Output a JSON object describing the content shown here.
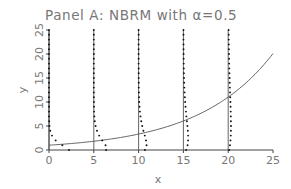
{
  "chart_data": {
    "type": "line",
    "title": "Panel A: NBRM with α=0.5",
    "xlabel": "x",
    "ylabel": "y",
    "xlim": [
      0,
      25
    ],
    "ylim": [
      0,
      25
    ],
    "xticks": [
      0,
      5,
      10,
      15,
      20,
      25
    ],
    "yticks": [
      0,
      5,
      10,
      15,
      20,
      25
    ],
    "grid": false,
    "legend": null,
    "series": [
      {
        "name": "mean curve",
        "kind": "line",
        "description": "exponential mean function, approx y = exp(0.12 x)",
        "x": [
          0,
          5,
          10,
          15,
          20,
          25
        ],
        "values": [
          1.0,
          1.8,
          3.3,
          6.0,
          11.0,
          20.0
        ]
      },
      {
        "name": "conditional distributions",
        "kind": "vertical reference lines with dotted density profiles",
        "x_positions": [
          0,
          5,
          10,
          15,
          20
        ],
        "description": "at each x, a vertical line from y=0 to 25 with dots showing the NB probability mass spread rightward (dots at each integer y)"
      }
    ]
  },
  "labels": {
    "title": "Panel A: NBRM with α=0.5",
    "xlabel": "x",
    "ylabel": "y"
  }
}
